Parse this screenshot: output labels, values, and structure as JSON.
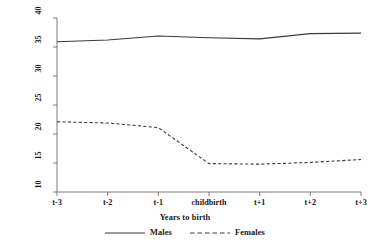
{
  "chart_data": {
    "type": "line",
    "title": "",
    "xlabel": "Years to birth",
    "ylabel": "Average number of hours worked",
    "categories": [
      "t-3",
      "t-2",
      "t-1",
      "childbirth",
      "t+1",
      "t+2",
      "t+3"
    ],
    "x": [
      0,
      1,
      2,
      3,
      4,
      5,
      6
    ],
    "ylim": [
      10,
      40
    ],
    "yticks": [
      10,
      15,
      20,
      25,
      30,
      35,
      40
    ],
    "ytick_labels": [
      "10",
      "15",
      "20",
      "25",
      "30",
      "35",
      "40"
    ],
    "grid": false,
    "legend_position": "bottom",
    "series": [
      {
        "name": "Males",
        "style": "solid",
        "color": "#3a3a3a",
        "values": [
          35.9,
          36.2,
          36.9,
          36.6,
          36.4,
          37.3,
          37.4
        ]
      },
      {
        "name": "Females",
        "style": "dashed",
        "color": "#3a3a3a",
        "values": [
          22.1,
          21.9,
          21.1,
          14.9,
          14.8,
          15.1,
          15.6
        ]
      }
    ]
  },
  "legend": {
    "items": [
      {
        "label": "Males",
        "style": "solid"
      },
      {
        "label": "Females",
        "style": "dashed"
      }
    ]
  }
}
